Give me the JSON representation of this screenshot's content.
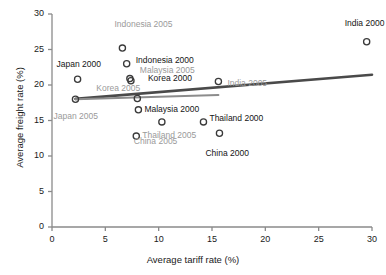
{
  "chart_data": {
    "type": "scatter",
    "title": "",
    "xlabel": "Average tariff rate (%)",
    "ylabel": "Average freight rate (%)",
    "xlim": [
      0,
      30
    ],
    "ylim": [
      0,
      30
    ],
    "xticks": [
      0,
      5,
      10,
      15,
      20,
      25,
      30
    ],
    "yticks": [
      0,
      5,
      10,
      15,
      20,
      25,
      30
    ],
    "xtick_labels": [
      "0",
      "5",
      "10",
      "15",
      "20",
      "25",
      "30"
    ],
    "ytick_labels": [
      "0",
      "5",
      "10",
      "15",
      "20",
      "25",
      "30"
    ],
    "grid": false,
    "legend": "none",
    "marker": "open-circle",
    "points": [
      {
        "label": "Japan 2005",
        "x": 2.2,
        "y": 18.0,
        "color": "#9a9a9a",
        "label_dx": -22,
        "label_dy": 17
      },
      {
        "label": "Japan 2000",
        "x": 2.4,
        "y": 20.8,
        "color": "#151515",
        "label_dx": -21,
        "label_dy": -15
      },
      {
        "label": "Indonesia 2005",
        "x": 6.6,
        "y": 25.2,
        "color": "#9a9a9a",
        "label_dx": -8,
        "label_dy": -24
      },
      {
        "label": "Indonesia 2000",
        "x": 7.0,
        "y": 23.0,
        "color": "#151515",
        "label_dx": 9,
        "label_dy": -4
      },
      {
        "label": "Malaysia 2005",
        "x": 7.3,
        "y": 20.9,
        "color": "#9a9a9a",
        "label_dx": 10,
        "label_dy": -9
      },
      {
        "label": "Korea 2000",
        "x": 7.4,
        "y": 20.6,
        "color": "#151515",
        "label_dx": 17,
        "label_dy": -3
      },
      {
        "label": "Korea 2005",
        "x": 8.0,
        "y": 18.1,
        "color": "#9a9a9a",
        "label_dx": -41,
        "label_dy": -10
      },
      {
        "label": "Malaysia 2000",
        "x": 8.1,
        "y": 16.5,
        "color": "#151515",
        "label_dx": 6,
        "label_dy": -1
      },
      {
        "label": "Thailand 2005",
        "x": 7.9,
        "y": 12.8,
        "color": "#9a9a9a",
        "label_dx": 6,
        "label_dy": -1
      },
      {
        "label": "China 2005",
        "x": 10.3,
        "y": 14.8,
        "color": "#9a9a9a",
        "label_dx": -28,
        "label_dy": 19
      },
      {
        "label": "Thailand 2000",
        "x": 14.2,
        "y": 14.8,
        "color": "#151515",
        "label_dx": 6,
        "label_dy": -4
      },
      {
        "label": "India 2005",
        "x": 15.6,
        "y": 20.5,
        "color": "#9a9a9a",
        "label_dx": 9,
        "label_dy": 2
      },
      {
        "label": "China 2000",
        "x": 15.7,
        "y": 13.2,
        "color": "#151515",
        "label_dx": -14,
        "label_dy": 20
      },
      {
        "label": "India 2000",
        "x": 29.5,
        "y": 26.1,
        "color": "#151515",
        "label_dx": -22,
        "label_dy": -19
      }
    ],
    "trendlines": [
      {
        "name": "trendline-2000",
        "x0": 2.2,
        "y0": 18.05,
        "x1": 30.0,
        "y1": 21.45,
        "color": "#4a4a4a",
        "width": 2.6
      },
      {
        "name": "trendline-2005",
        "x0": 2.2,
        "y0": 18.0,
        "x1": 15.6,
        "y1": 18.6,
        "color": "#8c8c8c",
        "width": 2.0
      }
    ],
    "axis_color": "#8a8a8a",
    "marker_color": "#3a3a3a"
  }
}
